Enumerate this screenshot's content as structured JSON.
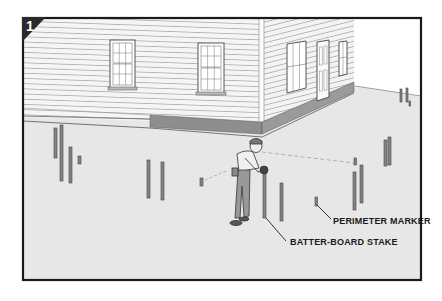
{
  "figure": {
    "step_number": "1",
    "callouts": [
      {
        "id": "perimeter-marker",
        "label": "PERIMETER MARKER"
      },
      {
        "id": "batter-board-stake",
        "label": "BATTER-BOARD STAKE"
      }
    ],
    "colors": {
      "frame": "#1a1a1a",
      "ground": "#e6e6e6",
      "siding": "#f4f4f4",
      "siding_line": "#9a9a9a",
      "foundation": "#8c8c8c",
      "stake": "#7a7a7a",
      "sky": "#ffffff"
    }
  }
}
